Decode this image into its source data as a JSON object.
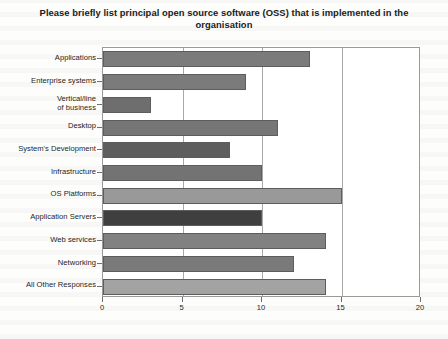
{
  "chart_data": {
    "type": "bar",
    "orientation": "horizontal",
    "title": "Please briefly list principal open source software (OSS) that is implemented in the organisation",
    "xlabel": "",
    "ylabel": "",
    "xlim": [
      0,
      20
    ],
    "xticks": [
      "0",
      "5",
      "10",
      "15",
      "20"
    ],
    "xtick_values": [
      0,
      5,
      10,
      15,
      20
    ],
    "grid": true,
    "grid_axis": "x",
    "legend": false,
    "categories": [
      "Applications",
      "Enterprise systems",
      "Vertical/line\nof business",
      "Desktop",
      "System's Development",
      "Infrastructure",
      "OS Platforms",
      "Application Servers",
      "Web services",
      "Networking",
      "All Other Responses"
    ],
    "values": [
      13,
      9,
      3,
      11,
      8,
      10,
      15,
      10,
      14,
      12,
      14
    ],
    "bars": [
      {
        "label": "Applications",
        "value": 13,
        "color": "#7b7b7b"
      },
      {
        "label": "Enterprise systems",
        "value": 9,
        "color": "#7b7b7b"
      },
      {
        "label": "Vertical/line of business",
        "value": 3,
        "color": "#6e6e6e"
      },
      {
        "label": "Desktop",
        "value": 11,
        "color": "#767676"
      },
      {
        "label": "System's Development",
        "value": 8,
        "color": "#5e5e5e"
      },
      {
        "label": "Infrastructure",
        "value": 10,
        "color": "#737373"
      },
      {
        "label": "OS Platforms",
        "value": 15,
        "color": "#999999"
      },
      {
        "label": "Application Servers",
        "value": 10,
        "color": "#3f3f3f"
      },
      {
        "label": "Web services",
        "value": 14,
        "color": "#818181"
      },
      {
        "label": "Networking",
        "value": 12,
        "color": "#7a7a7a"
      },
      {
        "label": "All Other Responses",
        "value": 14,
        "color": "#a3a3a3"
      }
    ],
    "axis_color": "#9a9a9a",
    "grid_color": "#a8a8a8",
    "plot_background": "#ffffff"
  }
}
